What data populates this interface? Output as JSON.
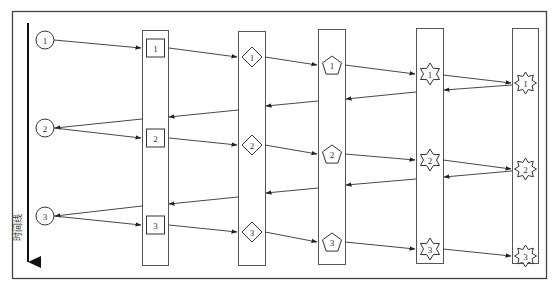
{
  "diagram": {
    "type": "sequence-timeline",
    "timeline_label": "时间线",
    "colors": {
      "stroke": "#333333",
      "frame": "#444444",
      "background": "#ffffff"
    },
    "origin": {
      "shape": "circle",
      "nodes": [
        {
          "label": "1",
          "x": 45,
          "y": 40
        },
        {
          "label": "2",
          "x": 45,
          "y": 128
        },
        {
          "label": "3",
          "x": 45,
          "y": 216
        }
      ]
    },
    "lanes": [
      {
        "id": "lane-1",
        "shape": "square",
        "x": 142,
        "y": 30,
        "w": 26,
        "h": 235,
        "nodes": [
          {
            "label": "1",
            "y": 48
          },
          {
            "label": "2",
            "y": 138
          },
          {
            "label": "3",
            "y": 225
          }
        ]
      },
      {
        "id": "lane-2",
        "shape": "diamond",
        "x": 238,
        "y": 31,
        "w": 27,
        "h": 234,
        "nodes": [
          {
            "label": "1",
            "y": 57
          },
          {
            "label": "2",
            "y": 145
          },
          {
            "label": "3",
            "y": 232
          }
        ]
      },
      {
        "id": "lane-3",
        "shape": "pentagon",
        "x": 318,
        "y": 29,
        "w": 27,
        "h": 235,
        "nodes": [
          {
            "label": "1",
            "y": 65
          },
          {
            "label": "2",
            "y": 154
          },
          {
            "label": "3",
            "y": 242
          }
        ]
      },
      {
        "id": "lane-4",
        "shape": "star6",
        "x": 416,
        "y": 28,
        "w": 27,
        "h": 235,
        "nodes": [
          {
            "label": "1",
            "y": 74
          },
          {
            "label": "2",
            "y": 160
          },
          {
            "label": "3",
            "y": 249
          }
        ]
      },
      {
        "id": "lane-5",
        "shape": "star8",
        "x": 512,
        "y": 28,
        "w": 26,
        "h": 235,
        "nodes": [
          {
            "label": "1",
            "y": 83
          },
          {
            "label": "2",
            "y": 169
          },
          {
            "label": "3",
            "y": 256
          }
        ]
      }
    ],
    "arrows": [
      {
        "from": [
          54,
          40
        ],
        "to": [
          141,
          48
        ]
      },
      {
        "from": [
          169,
          48
        ],
        "to": [
          237,
          57
        ]
      },
      {
        "from": [
          265,
          57
        ],
        "to": [
          317,
          65
        ]
      },
      {
        "from": [
          345,
          65
        ],
        "to": [
          415,
          74
        ]
      },
      {
        "from": [
          443,
          75
        ],
        "to": [
          511,
          83
        ]
      },
      {
        "from": [
          512,
          85
        ],
        "to": [
          444,
          90
        ]
      },
      {
        "from": [
          416,
          92
        ],
        "to": [
          346,
          99
        ]
      },
      {
        "from": [
          318,
          101
        ],
        "to": [
          266,
          106
        ]
      },
      {
        "from": [
          238,
          110
        ],
        "to": [
          169,
          117
        ]
      },
      {
        "from": [
          142,
          119
        ],
        "to": [
          55,
          128
        ]
      },
      {
        "from": [
          54,
          128
        ],
        "to": [
          141,
          138
        ]
      },
      {
        "from": [
          169,
          138
        ],
        "to": [
          237,
          145
        ]
      },
      {
        "from": [
          265,
          145
        ],
        "to": [
          317,
          154
        ]
      },
      {
        "from": [
          345,
          154
        ],
        "to": [
          415,
          160
        ]
      },
      {
        "from": [
          443,
          160
        ],
        "to": [
          511,
          169
        ]
      },
      {
        "from": [
          512,
          171
        ],
        "to": [
          444,
          177
        ]
      },
      {
        "from": [
          416,
          179
        ],
        "to": [
          346,
          185
        ]
      },
      {
        "from": [
          318,
          188
        ],
        "to": [
          266,
          193
        ]
      },
      {
        "from": [
          238,
          197
        ],
        "to": [
          169,
          204
        ]
      },
      {
        "from": [
          142,
          206
        ],
        "to": [
          55,
          216
        ]
      },
      {
        "from": [
          54,
          216
        ],
        "to": [
          141,
          225
        ]
      },
      {
        "from": [
          169,
          225
        ],
        "to": [
          237,
          232
        ]
      },
      {
        "from": [
          265,
          232
        ],
        "to": [
          317,
          242
        ]
      },
      {
        "from": [
          345,
          242
        ],
        "to": [
          415,
          249
        ]
      },
      {
        "from": [
          443,
          249
        ],
        "to": [
          511,
          256
        ]
      }
    ]
  }
}
